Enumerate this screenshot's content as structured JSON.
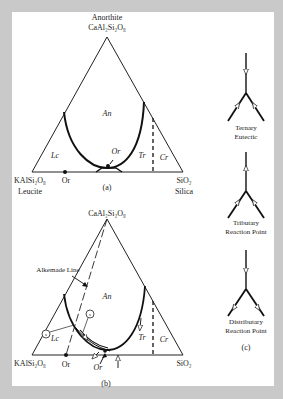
{
  "panel_a": {
    "apex_name": "Anorthite",
    "apex_formula": "CaAl₂Si₂O₈",
    "left_formula": "KAlSi₂O₈",
    "left_name": "Leucite",
    "right_formula": "SiO₂",
    "right_name": "Silica",
    "base_point_label": "Or",
    "fields": {
      "an": "An",
      "lc": "Lc",
      "or": "Or",
      "tr": "Tr",
      "cr": "Cr"
    },
    "caption": "(a)"
  },
  "panel_b": {
    "apex_formula": "CaAl₂Si₂O₈",
    "left_formula": "KAlSi₂O₈",
    "right_formula": "SiO₂",
    "base_point_label": "Or",
    "alkemade_label": "Alkemade Line",
    "circle_label_1": "s",
    "circle_label_2": "s",
    "fields": {
      "an": "An",
      "lc": "Lc",
      "or": "Or",
      "tr": "Tr",
      "cr": "Cr"
    },
    "caption": "(b)"
  },
  "panel_c": {
    "items": [
      {
        "line1": "Ternary",
        "line2": "Eutectic"
      },
      {
        "line1": "Tributary",
        "line2": "Reaction Point"
      },
      {
        "line1": "Distributary",
        "line2": "Reaction Point"
      }
    ],
    "caption": "(c)"
  },
  "colors": {
    "background": "#c9c9c9",
    "panel": "#ffffff",
    "ink": "#222222"
  }
}
